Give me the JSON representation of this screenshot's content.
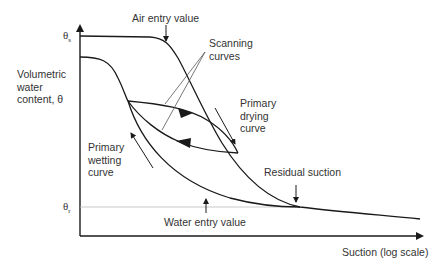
{
  "diagram": {
    "y_axis": {
      "label_lines": [
        "Volumetric",
        "water",
        "content, θ"
      ]
    },
    "x_axis": {
      "label": "Suction (log scale)"
    },
    "ticks": {
      "theta_s": "θ",
      "theta_s_sub": "s",
      "theta_r": "θ",
      "theta_r_sub": "r"
    },
    "annotations": {
      "air_entry": "Air entry value",
      "scanning": [
        "Scanning",
        "curves"
      ],
      "primary_drying": [
        "Primary",
        "drying",
        "curve"
      ],
      "primary_wetting": [
        "Primary",
        "wetting",
        "curve"
      ],
      "residual_suction": "Residual suction",
      "water_entry": "Water entry value"
    },
    "colors": {
      "line": "#1a1a1a",
      "text": "#333333",
      "residual_line": "#bbbbbb"
    }
  }
}
